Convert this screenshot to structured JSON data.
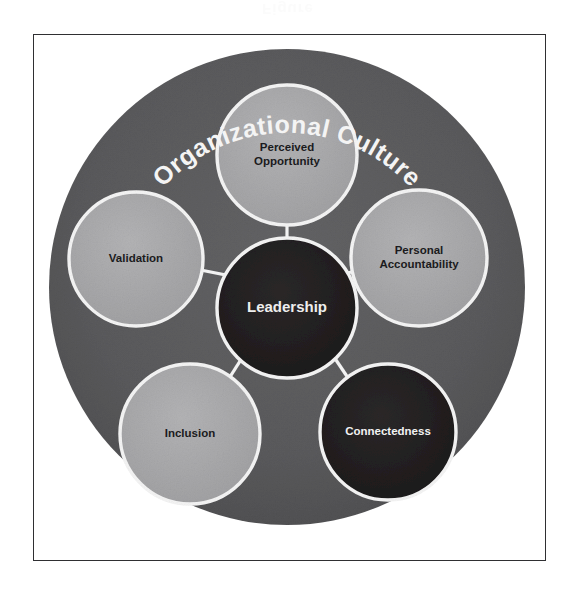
{
  "watermark_text": "Figure",
  "frame": {
    "border_color": "#2f2f32",
    "background": "#ffffff"
  },
  "diagram": {
    "type": "hub-and-spoke",
    "outer_ring": {
      "label": "Organizational Culture",
      "fill": "#5a5a5c",
      "label_color": "#f4f4f4",
      "label_style": "curved-arc-top"
    },
    "hub": {
      "label": "Leadership",
      "fill": "#221f20",
      "ring": "#f5f5f5",
      "label_color": "#eeeeee"
    },
    "nodes": [
      {
        "label": "Perceived Opportunity",
        "lines": [
          "Perceived",
          "Opportunity"
        ],
        "position": "top",
        "fill": "#aaaaac",
        "ring": "#f5f5f5",
        "label_color": "#1b1b1d",
        "tone": "light"
      },
      {
        "label": "Personal Accountability",
        "lines": [
          "Personal",
          "Accountability"
        ],
        "position": "right",
        "fill": "#a8a8aa",
        "ring": "#f5f5f5",
        "label_color": "#1b1b1d",
        "tone": "light"
      },
      {
        "label": "Connectedness",
        "lines": [
          "Connectedness"
        ],
        "position": "bottom-right",
        "fill": "#221f20",
        "ring": "#f5f5f5",
        "label_color": "#f2f2f2",
        "tone": "dark"
      },
      {
        "label": "Inclusion",
        "lines": [
          "Inclusion"
        ],
        "position": "bottom-left",
        "fill": "#a3a3a5",
        "ring": "#f5f5f5",
        "label_color": "#1b1b1d",
        "tone": "light"
      },
      {
        "label": "Validation",
        "lines": [
          "Validation"
        ],
        "position": "left",
        "fill": "#a8a8aa",
        "ring": "#f5f5f5",
        "label_color": "#1b1b1d",
        "tone": "light"
      }
    ],
    "connector_color": "#f2f2f2"
  }
}
